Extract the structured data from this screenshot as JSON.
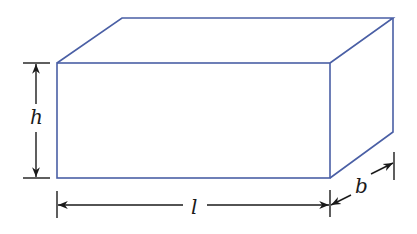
{
  "diagram": {
    "type": "rectangular-prism",
    "edge_color": "#4a5fa5",
    "dimension_color": "#1a1a1a",
    "labels": {
      "height": "h",
      "length": "l",
      "breadth": "b"
    }
  }
}
